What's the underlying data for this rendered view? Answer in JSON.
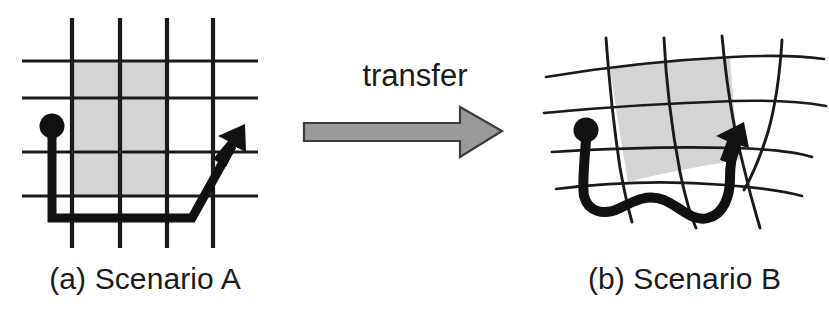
{
  "figure": {
    "background_color": "#ffffff"
  },
  "panels": {
    "a": {
      "caption": "(a) Scenario A",
      "description": "regular rectangular grid with shaded region, start dot and L-shaped path ending in arrow",
      "grid": {
        "type": "regular",
        "line_color": "#1a1a1a",
        "vertical_x": [
          72,
          120,
          167,
          213
        ],
        "horizontal_y": [
          61,
          98,
          152,
          196
        ],
        "extent_x": [
          22,
          258
        ],
        "extent_y": [
          18,
          248
        ]
      },
      "shaded_region": {
        "fill_color": "#d4d4d4",
        "x": 72,
        "y": 61,
        "width": 95,
        "height": 135
      },
      "start_dot": {
        "cx": 52,
        "cy": 126,
        "r": 12,
        "color": "#111111"
      },
      "path": {
        "color": "#111111",
        "stroke_width": 9,
        "points": "52,132 52,218 192,218 238,136"
      },
      "arrow_tip": {
        "x": 243,
        "y": 128
      }
    },
    "b": {
      "caption": "(b) Scenario B",
      "description": "warped curvilinear grid with shaded region, start dot and wavy path ending in arrow",
      "grid": {
        "type": "warped",
        "line_color": "#1a1a1a"
      },
      "shaded_region": {
        "fill_color": "#d4d4d4"
      },
      "start_dot": {
        "cx": 46,
        "cy": 130,
        "r": 12,
        "color": "#111111"
      },
      "path": {
        "color": "#111111",
        "stroke_width": 10
      },
      "arrow_tip": {
        "x": 194,
        "y": 145
      }
    }
  },
  "transfer": {
    "label": "transfer",
    "arrow": {
      "name": "right-arrow",
      "fill_color": "#9a9a9a",
      "stroke_color": "#3d3d3d",
      "x": 12,
      "y": 72,
      "length": 198,
      "shaft_height": 34,
      "head_width": 42,
      "head_height": 62
    }
  },
  "colors": {
    "ink": "#1a1a1a",
    "shade": "#d4d4d4",
    "arrow_gray": "#9a9a9a",
    "background": "#ffffff"
  }
}
